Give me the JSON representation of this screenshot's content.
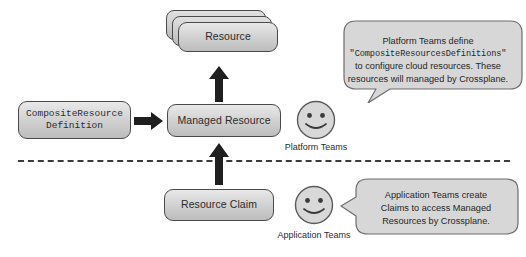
{
  "diagram": {
    "colors": {
      "box_fill_top": "#e9e9e9",
      "box_fill_bottom": "#bdbdbd",
      "box_border": "#4a4a4a",
      "arrow": "#1f1f1f",
      "divider": "#3b3b3b",
      "bubble_fill": "#d7d7d7",
      "bubble_border": "#6d6d6d",
      "text": "#2b2b2b",
      "background": "#ffffff"
    },
    "nodes": {
      "resource_stack": {
        "label": "Resource",
        "count": 3
      },
      "composite_resource_definition": {
        "label": "CompositeResource\nDefinition",
        "line1": "CompositeResource",
        "line2": "Definition"
      },
      "managed_resource": {
        "label": "Managed Resource"
      },
      "resource_claim": {
        "label": "Resource Claim"
      }
    },
    "personas": [
      {
        "id": "platform-teams",
        "label": "Platform Teams",
        "face": "smiley-face"
      },
      {
        "id": "application-teams",
        "label": "Application Teams",
        "face": "smiley-face"
      }
    ],
    "bubbles": {
      "platform": {
        "line1": "Platform Teams define",
        "line2": "\"CompositeResourcesDefinitions\"",
        "line3": "to configure cloud resources. These",
        "line4": "resources will managed by Crossplane."
      },
      "application": {
        "line1": "Application Teams create",
        "line2": "Claims to access Managed",
        "line3": "Resources by Crossplane."
      }
    },
    "arrows": [
      {
        "id": "crd-to-managed-resource",
        "direction": "right"
      },
      {
        "id": "managed-resource-to-resource",
        "direction": "up"
      },
      {
        "id": "resource-claim-to-managed-resource",
        "direction": "up"
      }
    ],
    "divider": {
      "id": "team-boundary-divider",
      "style": "dashed"
    }
  }
}
